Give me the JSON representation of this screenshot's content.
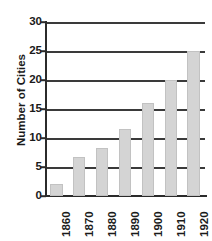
{
  "chart_data": {
    "type": "bar",
    "title": "",
    "xlabel": "",
    "ylabel": "Number of Cities",
    "categories": [
      "1860",
      "1870",
      "1880",
      "1890",
      "1900",
      "1910",
      "1920"
    ],
    "values": [
      2,
      6.7,
      8.3,
      11.5,
      16,
      20,
      25
    ],
    "ylim": [
      0,
      30
    ],
    "yticks": [
      0,
      5,
      10,
      15,
      20,
      25,
      30
    ],
    "ytick_labels": [
      "0",
      "5",
      "10",
      "15",
      "20",
      "25",
      "30"
    ],
    "grid": "horizontal",
    "legend": "none",
    "orientation": "vertical",
    "xtick_rotation": 90,
    "colors": {
      "bar_fill": "#d4d4d4",
      "bar_edge": "#c2c2c2",
      "gridline": "#3a3a3a",
      "axis": "#2b2b2b",
      "text": "#1a1a1a",
      "background": "#ffffff"
    }
  }
}
